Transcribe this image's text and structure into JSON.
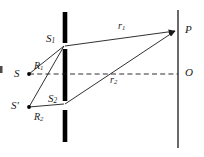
{
  "figure": {
    "type": "optics-ray-diagram",
    "background_color": "#ffffff",
    "stroke_color": "#1a1a1a",
    "barrier_color": "#000000"
  },
  "labels": {
    "source_s": {
      "text": "S",
      "sub": ""
    },
    "source_s_prime": {
      "text": "S′",
      "sub": ""
    },
    "slit_1": {
      "text": "S",
      "sub": "1"
    },
    "slit_2": {
      "text": "S",
      "sub": "2"
    },
    "path_r1": {
      "text": "r",
      "sub": "1"
    },
    "path_r2": {
      "text": "r",
      "sub": "2"
    },
    "path_R1": {
      "text": "R",
      "sub": "1"
    },
    "path_R2": {
      "text": "R",
      "sub": "2"
    },
    "point_p": {
      "text": "P",
      "sub": ""
    },
    "point_o": {
      "text": "O",
      "sub": ""
    }
  },
  "geometry": {
    "barrier_x": 65,
    "screen_x": 178,
    "axis_y": 74,
    "slit_1_y": 46,
    "slit_2_y": 104,
    "source_s": {
      "x": 29,
      "y": 74
    },
    "source_s_prime": {
      "x": 29,
      "y": 107
    },
    "point_p": {
      "x": 178,
      "y": 31
    },
    "point_o": {
      "x": 178,
      "y": 74
    },
    "barrier_segments": [
      {
        "y1": 12,
        "y2": 43
      },
      {
        "y1": 49,
        "y2": 101
      },
      {
        "y1": 110,
        "y2": 142
      }
    ],
    "screen": {
      "y1": 10,
      "y2": 148
    }
  }
}
